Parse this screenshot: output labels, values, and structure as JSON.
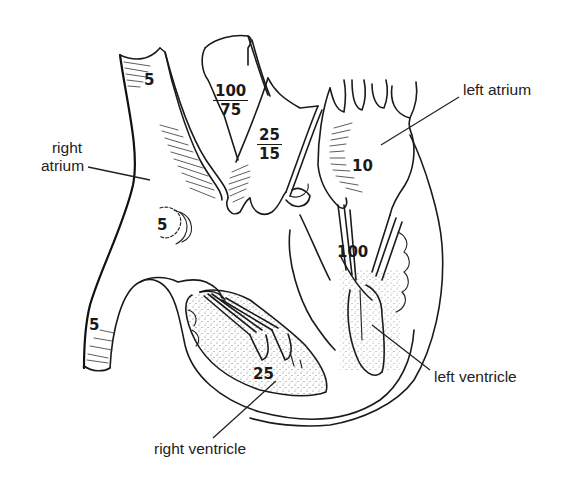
{
  "diagram": {
    "labels": {
      "right_atrium": [
        "right",
        "atrium"
      ],
      "left_atrium": "left atrium",
      "left_ventricle": "left ventricle",
      "right_ventricle": "right ventricle"
    },
    "pressures": {
      "superior_vena_cava": "5",
      "right_atrium": "5",
      "inferior_vena_cava": "5",
      "aorta": {
        "systolic": "100",
        "diastolic": "75"
      },
      "pulmonary_artery": {
        "systolic": "25",
        "diastolic": "15"
      },
      "left_atrium": "10",
      "left_ventricle": "100",
      "right_ventricle": "25"
    }
  }
}
